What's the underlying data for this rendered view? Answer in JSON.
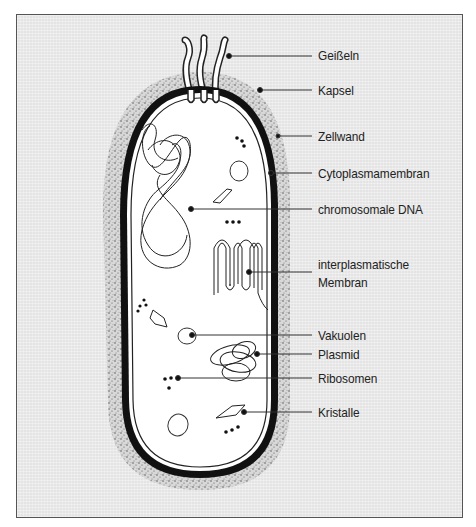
{
  "diagram": {
    "background_color": "#e4e4e4",
    "labels": [
      {
        "id": "geisseln",
        "text": "Geißeln"
      },
      {
        "id": "kapsel",
        "text": "Kapsel"
      },
      {
        "id": "zellwand",
        "text": "Zellwand"
      },
      {
        "id": "cytoplasmamembran",
        "text": "Cytoplasmamembran"
      },
      {
        "id": "chromosomale-dna",
        "text": "chromosomale DNA"
      },
      {
        "id": "interplasmatische-membran-1",
        "text": "interplasmatische"
      },
      {
        "id": "interplasmatische-membran-2",
        "text": "Membran"
      },
      {
        "id": "vakuolen",
        "text": "Vakuolen"
      },
      {
        "id": "plasmid",
        "text": "Plasmid"
      },
      {
        "id": "ribosomen",
        "text": "Ribosomen"
      },
      {
        "id": "kristalle",
        "text": "Kristalle"
      }
    ]
  }
}
